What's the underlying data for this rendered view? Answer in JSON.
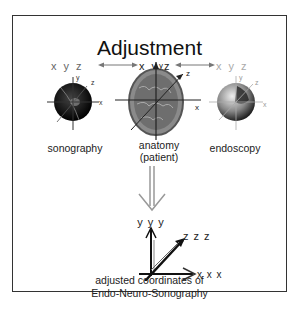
{
  "title": "Adjustment",
  "coordinate_sets": [
    {
      "label": "x y z",
      "color": "#666666"
    },
    {
      "label": "x y z",
      "color": "#222222"
    },
    {
      "label": "x y z",
      "color": "#aaaaaa"
    }
  ],
  "panels": [
    {
      "label": "sonography",
      "axes": [
        "y",
        "z",
        "x"
      ]
    },
    {
      "label": "anatomy\n(patient)",
      "label_line1": "anatomy",
      "label_line2": "(patient)",
      "axes": [
        "y",
        "z",
        "x"
      ]
    },
    {
      "label": "endoscopy",
      "axes": [
        "y",
        "z",
        "x"
      ]
    }
  ],
  "result_axes": {
    "y": "y y y",
    "z": "z z z",
    "x": "x x x"
  },
  "caption_line1": "adjusted coordinates of",
  "caption_line2": "Endo-Neuro-Sonography",
  "footer": "Fig. 2 Adjustment of the coordinate systems of the three modalities"
}
